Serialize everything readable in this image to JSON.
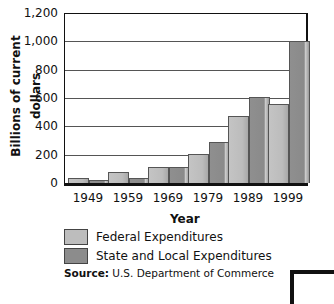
{
  "chart_data": {
    "type": "bar",
    "title": "",
    "xlabel": "Year",
    "ylabel": "Billions of current dollars",
    "categories": [
      "1949",
      "1959",
      "1969",
      "1979",
      "1989",
      "1999"
    ],
    "series": [
      {
        "name": "Federal Expenditures",
        "color": "#bdbdbd",
        "values": [
          38,
          80,
          115,
          208,
          470,
          555
        ]
      },
      {
        "name": "State and Local Expenditures",
        "color": "#8c8c8c",
        "values": [
          20,
          35,
          110,
          290,
          608,
          1000
        ]
      }
    ],
    "ylim": [
      0,
      1200
    ],
    "yticks": [
      "0",
      "200",
      "400",
      "600",
      "800",
      "1,000",
      "1,200"
    ],
    "grid": true,
    "legend_position": "bottom-left"
  },
  "axis": {
    "ylabel": "Billions of current dollars",
    "xlabel": "Year"
  },
  "legend": {
    "federal": "Federal Expenditures",
    "state": "State and Local Expenditures"
  },
  "source": {
    "label": "Source:",
    "text": " U.S. Department of Commerce"
  }
}
